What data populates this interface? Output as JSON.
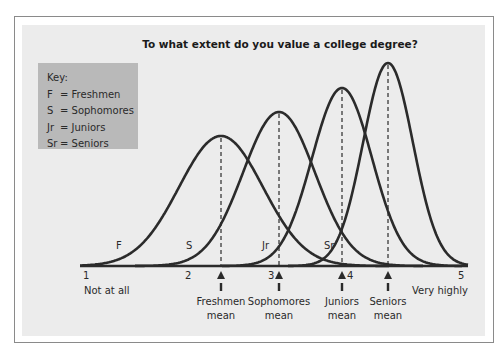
{
  "chart_data": {
    "type": "line",
    "title": "To what extent do you value a college degree?",
    "xlabel": "",
    "ylabel": "",
    "xlim": [
      1,
      5
    ],
    "x_ticks": [
      "1",
      "2",
      "3",
      "4",
      "5"
    ],
    "x_tick_annotations": {
      "1": "Not at all",
      "5": "Very highly"
    },
    "grid": false,
    "legend_position": "upper-left",
    "legend": {
      "title": "Key:",
      "entries": [
        {
          "abbr": "F",
          "label": "= Freshmen"
        },
        {
          "abbr": "S",
          "label": "= Sophomores"
        },
        {
          "abbr": "Jr",
          "label": "= Juniors"
        },
        {
          "abbr": "Sr",
          "label": "= Seniors"
        }
      ]
    },
    "series": [
      {
        "name": "Freshmen",
        "abbr": "F",
        "mean": 2.35,
        "relative_peak_height": 0.64,
        "spread": "widest",
        "mean_label": [
          "Freshmen",
          "mean"
        ]
      },
      {
        "name": "Sophomores",
        "abbr": "S",
        "mean": 3.1,
        "relative_peak_height": 0.76,
        "spread": "wide",
        "mean_label": [
          "Sophomores",
          "mean"
        ]
      },
      {
        "name": "Juniors",
        "abbr": "Jr",
        "mean": 3.9,
        "relative_peak_height": 0.88,
        "spread": "narrow",
        "mean_label": [
          "Juniors",
          "mean"
        ]
      },
      {
        "name": "Seniors",
        "abbr": "Sr",
        "mean": 4.4,
        "relative_peak_height": 1.0,
        "spread": "narrowest",
        "mean_label": [
          "Seniors",
          "mean"
        ]
      }
    ],
    "annotations": [
      "Dashed vertical line from each curve's peak to its mean",
      "Arrow markers under axis at each mean"
    ]
  },
  "render": {
    "axis_y": 266,
    "axis_x0": 80,
    "axis_x1": 468,
    "tick_px": [
      86,
      188,
      271,
      350,
      461
    ],
    "curves": [
      {
        "peak_x": 221,
        "peak_y": 136,
        "sigma": 42,
        "label_x": 116,
        "label_y": 246
      },
      {
        "peak_x": 279,
        "peak_y": 112,
        "sigma": 36,
        "label_x": 186,
        "label_y": 246
      },
      {
        "peak_x": 342,
        "peak_y": 88,
        "sigma": 30,
        "label_x": 262,
        "label_y": 246
      },
      {
        "peak_x": 388,
        "peak_y": 63,
        "sigma": 25,
        "label_x": 324,
        "label_y": 246
      }
    ],
    "line_color": "#2b2b2b"
  }
}
